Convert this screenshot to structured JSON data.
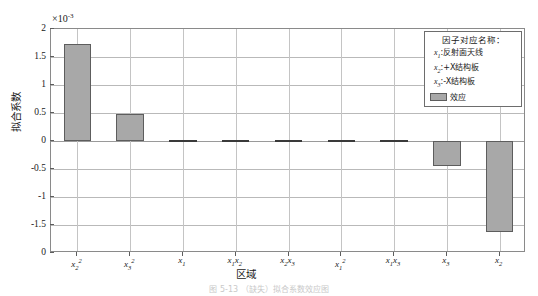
{
  "chart_data": {
    "type": "bar",
    "title": "",
    "xlabel": "区域",
    "ylabel": "拟合系数",
    "multiplier_prefix": "×10",
    "multiplier_exponent": "-3",
    "ylim": [
      -2,
      2
    ],
    "yticks": [
      "2",
      "1.5",
      "1",
      "0.5",
      "0",
      "-0.5",
      "-1",
      "-1.5",
      "0"
    ],
    "ytick_values": [
      2,
      1.5,
      1,
      0.5,
      0,
      -0.5,
      -1,
      -1.5,
      -2
    ],
    "grid": true,
    "legend_position": "top-right",
    "categories": [
      "x_2^2",
      "x_3^2",
      "x_1",
      "x_1x_2",
      "x_2x_3",
      "x_1^2",
      "x_1x_3",
      "x_3",
      "x_2"
    ],
    "category_labels_html": [
      "x<sub>2</sub><sup>2</sup>",
      "x<sub>3</sub><sup>2</sup>",
      "x<sub>1</sub>",
      "x<sub>1</sub>x<sub>2</sub>",
      "x<sub>2</sub>x<sub>3</sub>",
      "x<sub>1</sub><sup>2</sup>",
      "x<sub>1</sub>x<sub>3</sub>",
      "x<sub>3</sub>",
      "x<sub>2</sub>"
    ],
    "values": [
      1.73,
      0.49,
      0.02,
      0.02,
      0.0,
      0.0,
      0.0,
      -0.45,
      -1.62
    ],
    "series_name": "效应",
    "bar_color": "#a8a8a8",
    "bar_edge_color": "#5d5d5d"
  },
  "legend": {
    "title": "因子对应名称：",
    "entries": [
      {
        "symbol": "x",
        "sub": "1",
        "sep": ":",
        "name": "反射面天线"
      },
      {
        "symbol": "x",
        "sub": "2",
        "sep": ":",
        "name": "+X结构板"
      },
      {
        "symbol": "x",
        "sub": "3",
        "sep": ":",
        "name": "-X结构板"
      }
    ],
    "series_label": "效应"
  },
  "caption": {
    "text": "图 5-13  （缺失）拟合系数效应图"
  }
}
